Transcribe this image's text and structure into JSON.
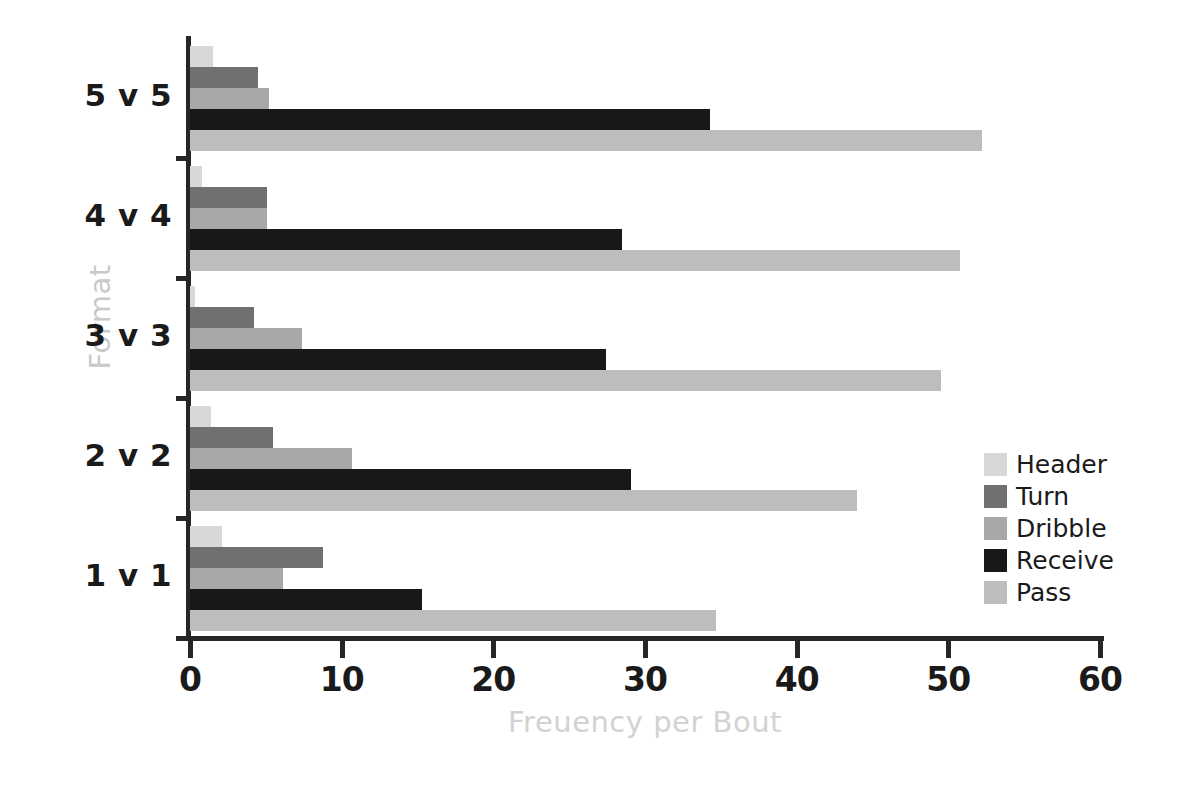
{
  "chart_data": {
    "type": "bar",
    "orientation": "horizontal",
    "title": "",
    "xlabel": "Freuency per Bout",
    "ylabel": "Format",
    "categories": [
      "1v1",
      "2v2",
      "3v3",
      "4v4",
      "5v5"
    ],
    "category_order_top_to_bottom": [
      "5v5",
      "4v4",
      "3v3",
      "2v2",
      "1v1"
    ],
    "xlim": [
      0,
      60
    ],
    "xticks": [
      0,
      10,
      20,
      30,
      40,
      50,
      60
    ],
    "xticklabels": [
      "0",
      "10",
      "20",
      "30",
      "40",
      "50",
      "60"
    ],
    "grid": false,
    "legend_position": "right",
    "series": [
      {
        "name": "Header",
        "color": "#d8d8d8",
        "values": [
          2.1,
          1.4,
          0.3,
          0.8,
          1.5
        ]
      },
      {
        "name": "Turn",
        "color": "#707070",
        "values": [
          8.8,
          5.5,
          4.2,
          5.1,
          4.5
        ]
      },
      {
        "name": "Dribble",
        "color": "#a8a8a8",
        "values": [
          6.1,
          10.7,
          7.4,
          5.1,
          5.2
        ]
      },
      {
        "name": "Receive",
        "color": "#181818",
        "values": [
          15.3,
          29.1,
          27.4,
          28.5,
          34.3
        ]
      },
      {
        "name": "Pass",
        "color": "#bdbdbd",
        "values": [
          34.7,
          44.0,
          49.5,
          50.8,
          52.2
        ]
      }
    ]
  },
  "legend": {
    "items": [
      {
        "label": "Header",
        "color": "#d8d8d8"
      },
      {
        "label": "Turn",
        "color": "#707070"
      },
      {
        "label": "Dribble",
        "color": "#a8a8a8"
      },
      {
        "label": "Receive",
        "color": "#181818"
      },
      {
        "label": "Pass",
        "color": "#bdbdbd"
      }
    ]
  },
  "axes": {
    "x_title": "Freuency per Bout",
    "y_title": "Format",
    "x_title_color": "#d2d2d2",
    "y_title_color": "#c9c9c9",
    "axis_color": "#262626"
  }
}
